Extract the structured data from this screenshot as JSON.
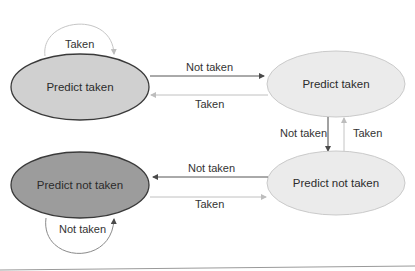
{
  "diagram": {
    "title": "",
    "colors": {
      "strong_fill": "#cfcfcf",
      "strong_stroke": "#3a3a3a",
      "weak_fill": "#eaeaea",
      "weak_stroke": "#c4c4c4",
      "not_taken_strong_fill": "#9a9a9a",
      "arrow_dark": "#4a4a4a",
      "arrow_light": "#bdbdbd"
    },
    "states": [
      {
        "id": "s0",
        "label": "Predict taken"
      },
      {
        "id": "s1",
        "label": "Predict taken"
      },
      {
        "id": "s2",
        "label": "Predict not taken"
      },
      {
        "id": "s3",
        "label": "Predict not taken"
      }
    ],
    "transitions": [
      {
        "from": "s0",
        "to": "s0",
        "label": "Taken"
      },
      {
        "from": "s0",
        "to": "s1",
        "label": "Not taken"
      },
      {
        "from": "s1",
        "to": "s0",
        "label": "Taken"
      },
      {
        "from": "s1",
        "to": "s2",
        "label": "Not taken"
      },
      {
        "from": "s2",
        "to": "s1",
        "label": "Taken"
      },
      {
        "from": "s2",
        "to": "s3",
        "label": "Not taken"
      },
      {
        "from": "s3",
        "to": "s2",
        "label": "Taken"
      },
      {
        "from": "s3",
        "to": "s3",
        "label": "Not taken"
      }
    ]
  }
}
